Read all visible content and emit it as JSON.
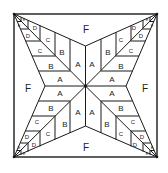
{
  "diagram": {
    "type": "quilt-block-pattern",
    "colors": {
      "line": "#1a1a1a",
      "background": "#ffffff"
    },
    "labels": {
      "F": "F",
      "A": "A",
      "B": "B",
      "C": "C",
      "D": "D",
      "E": "E"
    }
  }
}
